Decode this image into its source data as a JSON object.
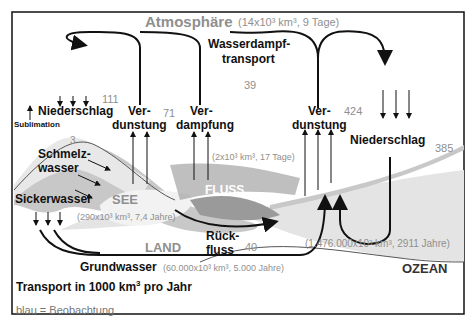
{
  "title": {
    "atmosphere": "Atmosphäre",
    "atmosphere_stats": "(14x10³ km³, 9 Tage)"
  },
  "labels": {
    "wasserdampf_line1": "Wasserdampf-",
    "wasserdampf_line2": "transport",
    "niederschlag_land": "Niederschlag",
    "sublimation": "Sublimation",
    "verdunstung_land_1": "Ver-",
    "verdunstung_land_2": "dunstung",
    "verdampfung_1": "Ver-",
    "verdampfung_2": "dampfung",
    "verdunstung_ocean_1": "Ver-",
    "verdunstung_ocean_2": "dunstung",
    "niederschlag_ocean": "Niederschlag",
    "schmelz_1": "Schmelz-",
    "schmelz_2": "wasser",
    "sickerwasser": "Sickerwasser",
    "see": "SEE",
    "see_stats": "(290x10³ km³,  7,4 Jahre)",
    "fluss": "FLUSS",
    "fluss_stats": "(2x10³ km³, 17 Tage)",
    "land": "LAND",
    "rueck_1": "Rück-",
    "rueck_2": "fluss",
    "grundwasser": "Grundwasser",
    "grundwasser_stats": "(60.000x10³ km³, 5.000 Jahre)",
    "ocean_stats": "(1.476.000x10³ km³, 2911 Jahre)",
    "ozean": "OZEAN",
    "transport_note": "Transport in 1000 km",
    "transport_sup": "3",
    "transport_tail": " pro Jahr",
    "legend": "blau = Beobachtung"
  },
  "values": {
    "niederschlag_land": "111",
    "sublimation_value": "3",
    "verdunstung_land": "71",
    "wasserdampf": "39",
    "verdunstung_ocean": "424",
    "niederschlag_ocean": "385",
    "rueckfluss": "40"
  },
  "colors": {
    "observation": "#8f8f8f",
    "text": "#111111",
    "land_fill": "#c8c8c8",
    "water_fill": "#e4e4e4"
  }
}
